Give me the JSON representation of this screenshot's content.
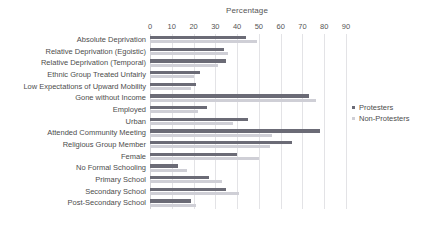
{
  "chart_data": {
    "type": "bar",
    "orientation": "horizontal",
    "title": "Percentage",
    "xlabel": "Percentage",
    "ylabel": "",
    "xlim": [
      0,
      90
    ],
    "xticks": [
      0,
      10,
      20,
      30,
      40,
      50,
      60,
      70,
      80,
      90
    ],
    "grid": true,
    "legend_position": "right",
    "categories": [
      "Absolute Deprivation",
      "Relative Deprivation (Egoistic)",
      "Relative Deprivation (Temporal)",
      "Ethnic Group Treated Unfairly",
      "Low Expectations of Upward Mobility",
      "Gone without Income",
      "Employed",
      "Urban",
      "Attended Community Meeting",
      "Religious Group Member",
      "Female",
      "No Formal Schooling",
      "Primary School",
      "Secondary School",
      "Post-Secondary School"
    ],
    "series": [
      {
        "name": "Protesters",
        "color": "#6b6b76",
        "values": [
          44,
          34,
          35,
          23,
          21,
          73,
          26,
          45,
          78,
          65,
          40,
          13,
          27,
          35,
          19
        ]
      },
      {
        "name": "Non-Protesters",
        "color": "#cfcfd6",
        "values": [
          49,
          36,
          31,
          20,
          19,
          76,
          22,
          38,
          56,
          55,
          50,
          17,
          33,
          41,
          21
        ]
      }
    ]
  },
  "legend": {
    "items": [
      {
        "label": "Protesters"
      },
      {
        "label": "Non-Protesters"
      }
    ]
  }
}
